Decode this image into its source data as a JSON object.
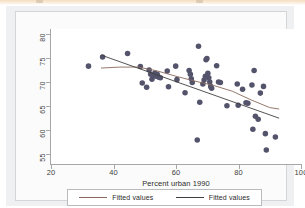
{
  "document": {
    "page_top_strip_color": "#f6ddc0",
    "graph_background": "#eef0f1",
    "plot_background": "#ffffff"
  },
  "chart_data": {
    "type": "scatter",
    "title": "",
    "xlabel": "Percent urban 1990",
    "ylabel": "",
    "xlim": [
      20,
      100
    ],
    "ylim": [
      53,
      81
    ],
    "xticks": [
      20,
      40,
      60,
      80,
      100
    ],
    "yticks": [
      55,
      60,
      65,
      70,
      75,
      80
    ],
    "grid": false,
    "legend_position": "bottom",
    "marker_color": "#53536b",
    "marker_size": 4,
    "series": [
      {
        "name": "Scatter",
        "type": "scatter",
        "points": [
          [
            32.0,
            73.3
          ],
          [
            36.5,
            75.2
          ],
          [
            44.5,
            75.9
          ],
          [
            48.6,
            73.2
          ],
          [
            49.2,
            69.8
          ],
          [
            50.6,
            68.9
          ],
          [
            51.4,
            72.5
          ],
          [
            51.9,
            71.6
          ],
          [
            52.3,
            70.6
          ],
          [
            52.8,
            71.4
          ],
          [
            53.2,
            71.8
          ],
          [
            53.6,
            71.2
          ],
          [
            54.0,
            71.6
          ],
          [
            54.5,
            71.0
          ],
          [
            55.0,
            70.9
          ],
          [
            57.2,
            72.3
          ],
          [
            57.6,
            69.0
          ],
          [
            59.9,
            73.3
          ],
          [
            60.3,
            70.5
          ],
          [
            62.9,
            67.8
          ],
          [
            64.2,
            72.4
          ],
          [
            64.6,
            71.6
          ],
          [
            64.9,
            70.7
          ],
          [
            65.2,
            69.9
          ],
          [
            66.8,
            58.0
          ],
          [
            67.2,
            77.4
          ],
          [
            67.6,
            65.8
          ],
          [
            68.6,
            69.6
          ],
          [
            69.0,
            70.4
          ],
          [
            69.4,
            71.2
          ],
          [
            69.6,
            74.6
          ],
          [
            69.9,
            74.9
          ],
          [
            70.2,
            71.8
          ],
          [
            70.5,
            70.9
          ],
          [
            70.8,
            70.0
          ],
          [
            71.1,
            69.1
          ],
          [
            71.4,
            68.7
          ],
          [
            73.0,
            73.4
          ],
          [
            73.6,
            70.0
          ],
          [
            74.2,
            69.9
          ],
          [
            76.3,
            65.1
          ],
          [
            79.6,
            69.6
          ],
          [
            79.9,
            65.2
          ],
          [
            81.3,
            68.5
          ],
          [
            82.4,
            65.7
          ],
          [
            83.0,
            65.6
          ],
          [
            84.3,
            69.4
          ],
          [
            84.6,
            60.2
          ],
          [
            85.0,
            72.4
          ],
          [
            85.4,
            62.9
          ],
          [
            86.3,
            62.3
          ],
          [
            87.0,
            67.7
          ],
          [
            88.0,
            69.1
          ],
          [
            88.6,
            59.3
          ],
          [
            88.9,
            55.9
          ],
          [
            91.8,
            58.6
          ]
        ]
      },
      {
        "name": "Fitted values",
        "type": "line",
        "style": "lowess",
        "color": "#8a6a5e",
        "points": [
          [
            36.0,
            72.9
          ],
          [
            42.0,
            73.1
          ],
          [
            48.0,
            73.1
          ],
          [
            54.0,
            72.3
          ],
          [
            60.0,
            71.2
          ],
          [
            66.0,
            70.2
          ],
          [
            72.0,
            69.3
          ],
          [
            78.0,
            68.1
          ],
          [
            84.0,
            66.3
          ],
          [
            90.0,
            64.7
          ],
          [
            93.0,
            64.4
          ]
        ]
      },
      {
        "name": "Fitted values",
        "type": "line",
        "style": "linear",
        "color": "#3f3f3f",
        "points": [
          [
            36.0,
            75.6
          ],
          [
            93.0,
            62.5
          ]
        ]
      }
    ],
    "legend_entries": [
      {
        "label": "Fitted values",
        "color": "#8a6a5e"
      },
      {
        "label": "Fitted values",
        "color": "#3f3f3f"
      }
    ]
  }
}
